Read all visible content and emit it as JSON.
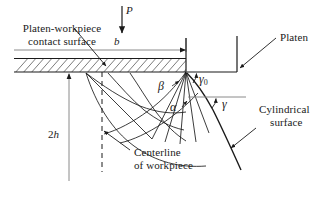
{
  "figure": {
    "kind": "slip-line-field-diagram",
    "width_px": 329,
    "height_px": 201,
    "background_color": "#ffffff",
    "line_color": "#1a1a1a",
    "hatch_color": "#6d6d6d"
  },
  "labels": {
    "platen_workpiece_contact_surface_line1": "Platen-workpiece",
    "platen_workpiece_contact_surface_line2": "contact surface",
    "load_P": "P",
    "width_b": "b",
    "platen": "Platen",
    "height_2h_prefix": "2",
    "height_2h_symbol": "h",
    "centerline_line1": "Centerline",
    "centerline_line2": "of workpiece",
    "cylindrical_surface_line1": "Cylindrical",
    "cylindrical_surface_line2": "surface",
    "alpha": "α",
    "beta": "β",
    "gamma_zero_symbol": "γ",
    "gamma_zero_subscript": "0",
    "gamma": "γ"
  },
  "geometry": {
    "hatched_band": {
      "x_left": 14,
      "x_right": 186,
      "y_top": 58,
      "y_bottom": 72,
      "description": "platen-workpiece contact band with 45-degree hatching"
    },
    "top_surface_line_y": 50,
    "contact_surface_y": 72,
    "apex_x": 186,
    "apex_y": 72,
    "platen_vertical_x": 186,
    "platen_right_x": 237,
    "load_arrow": {
      "x": 122,
      "y_start": 6,
      "y_end": 34
    },
    "dimension_b": {
      "y": 50,
      "x_start": 14,
      "x_end": 186
    },
    "dimension_2h": {
      "x": 69,
      "y_start": 74,
      "y_end": 180
    },
    "centerline_dashed": {
      "x": 102,
      "y_start": 72,
      "y_end": 172
    }
  },
  "annotations": {
    "slip_lines": "alpha and beta families of slip lines forming a centred fan from the platen edge",
    "free_surface": "cylindrical bulged free surface on the right of the workpiece"
  }
}
